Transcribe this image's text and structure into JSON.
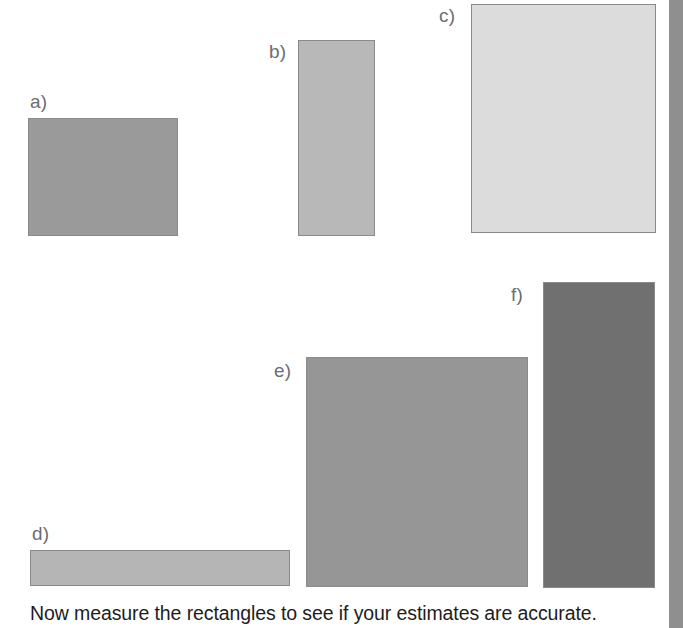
{
  "figure": {
    "width": 683,
    "height": 628,
    "background_color": "#ffffff",
    "caption": "Now measure the rectangles to see if your estimates are accurate.",
    "label_color": "#6d6d6d",
    "caption_color": "#1d1d1d",
    "border_color": "#8a8a8a",
    "page_edge_color": "#8f8f8f"
  },
  "chart_data": {
    "type": "bar",
    "title": "",
    "subtitle": "",
    "xlabel": "",
    "ylabel": "",
    "legend": [],
    "grid": false,
    "note": "Six free-standing shaded rectangles of differing size used for visual size-estimation; dimensions given in screen pixels.",
    "categories": [
      "a)",
      "b)",
      "c)",
      "d)",
      "e)",
      "f)"
    ],
    "values": [
      17700,
      15092,
      42435,
      9360,
      51060,
      34272
    ],
    "units": "square pixels",
    "rectangles": [
      {
        "label": "a)",
        "x": 28,
        "y": 118,
        "width": 150,
        "height": 118,
        "fill": "#9a9a9a",
        "label_x": 30,
        "label_y": 92
      },
      {
        "label": "b)",
        "x": 298,
        "y": 40,
        "width": 77,
        "height": 196,
        "fill": "#b8b8b8",
        "label_x": 269,
        "label_y": 42
      },
      {
        "label": "c)",
        "x": 471,
        "y": 4,
        "width": 185,
        "height": 229,
        "fill": "#dcdcdc",
        "label_x": 439,
        "label_y": 6
      },
      {
        "label": "d)",
        "x": 30,
        "y": 550,
        "width": 260,
        "height": 36,
        "fill": "#b5b5b5",
        "label_x": 32,
        "label_y": 524
      },
      {
        "label": "e)",
        "x": 306,
        "y": 357,
        "width": 222,
        "height": 230,
        "fill": "#969696",
        "label_x": 274,
        "label_y": 361
      },
      {
        "label": "f)",
        "x": 543,
        "y": 282,
        "width": 112,
        "height": 306,
        "fill": "#707070",
        "label_x": 511,
        "label_y": 285
      }
    ]
  }
}
